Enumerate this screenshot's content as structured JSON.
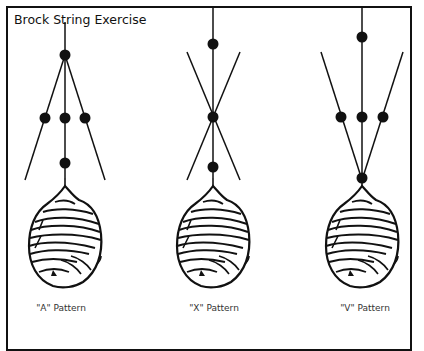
{
  "header": {
    "cut_off_title": ""
  },
  "diagram": {
    "title": "Brock String Exercise",
    "patterns": [
      {
        "id": "A",
        "label": "\"A\" Pattern",
        "center_x": 65
      },
      {
        "id": "X",
        "label": "\"X\" Pattern",
        "center_x": 213
      },
      {
        "id": "V",
        "label": "\"V\" Pattern",
        "center_x": 362
      }
    ]
  },
  "colors": {
    "ink": "#111111",
    "background": "#ffffff",
    "label_text": "#333333"
  }
}
